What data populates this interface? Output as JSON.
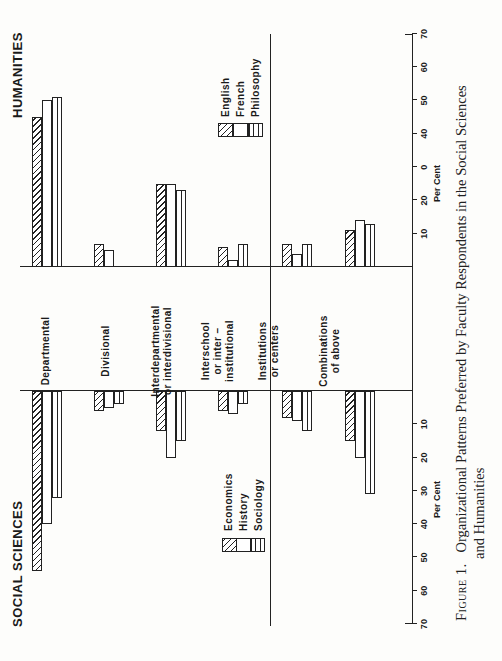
{
  "chart_data": {
    "type": "bar",
    "orientation": "diverging horizontal bars (page printed rotated 90°)",
    "title": "Organizational Patterns Preferred by Faculty Respondents in the Social Sciences and Humanities",
    "caption_prefix": "Figure 1.",
    "categories": [
      "Departmental",
      "Divisional",
      "Interdepartmental or interdivisional",
      "Interschool or inter-institutional",
      "Institutions or centers",
      "Combinations of above"
    ],
    "panels": [
      {
        "name": "SOCIAL SCIENCES",
        "xlabel": "Per Cent",
        "xlim": [
          0,
          70
        ],
        "ticks": [
          10,
          20,
          30,
          40,
          50,
          60,
          70
        ],
        "series": [
          {
            "name": "Economics",
            "pattern": "diagonal-hatch",
            "values": [
              54,
              6,
              12,
              6,
              8,
              15
            ]
          },
          {
            "name": "History",
            "pattern": "plain",
            "values": [
              40,
              5,
              20,
              7,
              9,
              20
            ]
          },
          {
            "name": "Sociology",
            "pattern": "horizontal-lines",
            "values": [
              32,
              4,
              15,
              4,
              12,
              31
            ]
          }
        ]
      },
      {
        "name": "HUMANITIES",
        "xlabel": "Per Cent",
        "xlim": [
          0,
          70
        ],
        "ticks": [
          10,
          20,
          "0",
          40,
          50,
          60,
          70
        ],
        "series": [
          {
            "name": "English",
            "pattern": "diagonal-hatch",
            "values": [
              45,
              7,
              25,
              6,
              7,
              11
            ]
          },
          {
            "name": "French",
            "pattern": "plain",
            "values": [
              50,
              5,
              25,
              2,
              4,
              14
            ]
          },
          {
            "name": "Philosophy",
            "pattern": "horizontal-lines",
            "values": [
              51,
              0,
              23,
              7,
              7,
              13
            ]
          }
        ]
      }
    ],
    "legend_position": "below each panel",
    "grid": false
  },
  "figure": {
    "social_title": "SOCIAL SCIENCES",
    "humanities_title": "HUMANITIES",
    "category_labels": [
      "Departmental",
      "Divisional",
      "Interdepartmental\nor interdivisional",
      "Interschool\nor inter –\ninstitutional",
      "Institutions\nor centers",
      "Combinations\nof above"
    ],
    "social_legend": [
      "Economics",
      "History",
      "Sociology"
    ],
    "humanities_legend": [
      "English",
      "French",
      "Philosophy"
    ],
    "axis_title": "Per Cent",
    "social_ticks": [
      "70",
      "60",
      "50",
      "40",
      "30",
      "20",
      "10"
    ],
    "humanities_ticks": [
      "10",
      "20",
      "0",
      "40",
      "50",
      "60",
      "70"
    ],
    "caption_label": "Figure 1.",
    "caption_line1": "Organizational Patterns Preferred by Faculty Respondents in the Social Sciences",
    "caption_line2": "and Humanities"
  }
}
